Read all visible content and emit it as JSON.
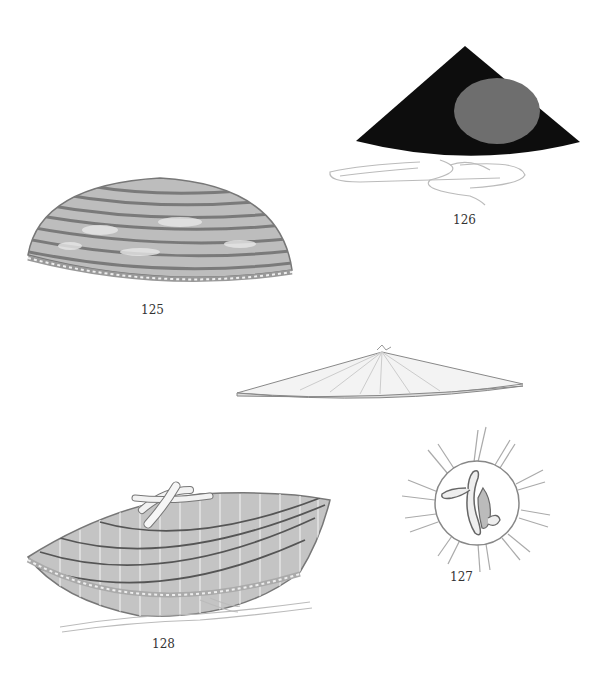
{
  "plate": {
    "figures": [
      {
        "number": "125",
        "subject": "domed woven hat with horizontal bands"
      },
      {
        "number": "126",
        "subject": "black conical hat with grey disc and white cords"
      },
      {
        "number": "127",
        "subject": "top view of hat with knotted tie and radiating ribs"
      },
      {
        "number": "128",
        "subject": "conical woven straw hat with cross-strap and cords"
      }
    ],
    "unlabeled": [
      {
        "subject": "flat shallow conical hat, side view"
      }
    ]
  },
  "colors": {
    "background": "#ffffff",
    "hat126_black": "#0d0d0d",
    "hat126_disc": "#6e6e6e",
    "weave_gray": "#8a8a8a",
    "sketch_line": "#9a9a9a"
  }
}
